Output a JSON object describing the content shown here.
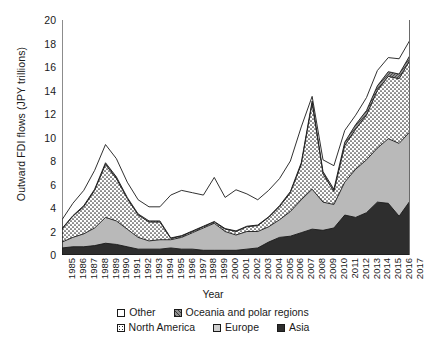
{
  "chart_data": {
    "type": "area",
    "title": "",
    "xlabel": "Year",
    "ylabel": "Outward FDI flows (JPY trillions)",
    "ylim": [
      0,
      20
    ],
    "yticks": [
      0,
      2,
      4,
      6,
      8,
      10,
      12,
      14,
      16,
      18,
      20
    ],
    "grid": false,
    "stacked": true,
    "legend_position": "bottom",
    "categories": [
      "1985",
      "1986",
      "1987",
      "1988",
      "1989",
      "1990",
      "1991",
      "1992",
      "1993",
      "1994",
      "1995",
      "1996",
      "1997",
      "1998",
      "1999",
      "2000",
      "2001",
      "2002",
      "2003",
      "2004",
      "2005",
      "2006",
      "2007",
      "2008",
      "2009",
      "2010",
      "2011",
      "2012",
      "2013",
      "2014",
      "2015",
      "2016",
      "2017"
    ],
    "series": [
      {
        "name": "Asia",
        "fill": "#2e2e2e",
        "pattern": "solid-dark",
        "values": [
          0.6,
          0.7,
          0.7,
          0.8,
          1.0,
          0.9,
          0.7,
          0.5,
          0.5,
          0.5,
          0.6,
          0.5,
          0.5,
          0.4,
          0.4,
          0.4,
          0.4,
          0.5,
          0.6,
          1.1,
          1.5,
          1.6,
          1.9,
          2.2,
          2.1,
          2.3,
          3.4,
          3.2,
          3.6,
          4.5,
          4.4,
          3.3,
          4.6
        ]
      },
      {
        "name": "Europe",
        "fill": "#b9b9b9",
        "pattern": "solid-light",
        "values": [
          0.5,
          0.8,
          1.1,
          1.5,
          2.2,
          2.0,
          1.5,
          1.0,
          0.7,
          0.8,
          0.7,
          1.0,
          1.4,
          1.9,
          2.3,
          1.6,
          1.3,
          1.5,
          1.4,
          1.3,
          1.5,
          2.1,
          2.8,
          3.4,
          2.4,
          2.0,
          2.8,
          4.1,
          4.5,
          4.6,
          5.5,
          6.2,
          5.9
        ]
      },
      {
        "name": "North America",
        "fill": "#ffffff",
        "pattern": "dotted",
        "values": [
          1.1,
          1.8,
          2.3,
          3.2,
          4.5,
          3.6,
          2.6,
          1.9,
          1.6,
          1.5,
          0.1,
          0.1,
          0.1,
          0.1,
          0.1,
          0.2,
          0.3,
          0.4,
          0.5,
          0.8,
          1.1,
          1.6,
          3.0,
          7.3,
          2.4,
          1.1,
          3.1,
          3.4,
          3.8,
          4.9,
          5.3,
          5.5,
          6.1
        ]
      },
      {
        "name": "Oceania and polar regions",
        "fill": "#8f8f8f",
        "pattern": "hatch",
        "values": [
          0.05,
          0.05,
          0.1,
          0.1,
          0.15,
          0.15,
          0.1,
          0.1,
          0.1,
          0.1,
          0.05,
          0.05,
          0.05,
          0.05,
          0.05,
          0.05,
          0.05,
          0.05,
          0.05,
          0.05,
          0.1,
          0.1,
          0.15,
          0.2,
          0.2,
          0.2,
          0.3,
          0.4,
          0.4,
          0.4,
          0.4,
          0.4,
          0.4
        ]
      },
      {
        "name": "Other",
        "fill": "#ffffff",
        "pattern": "open",
        "values": [
          0.75,
          1.05,
          1.3,
          1.6,
          1.55,
          1.55,
          1.3,
          1.2,
          1.2,
          1.2,
          3.65,
          3.85,
          3.25,
          2.65,
          3.75,
          2.65,
          3.5,
          2.75,
          2.15,
          2.25,
          2.3,
          2.6,
          3.05,
          0.4,
          1.0,
          2.0,
          1.0,
          0.8,
          1.1,
          1.3,
          1.2,
          1.3,
          1.3
        ]
      }
    ],
    "totals": [
      3.0,
      4.4,
      5.5,
      7.2,
      9.4,
      8.2,
      6.2,
      4.7,
      4.1,
      4.1,
      5.1,
      5.5,
      5.3,
      5.1,
      6.6,
      4.9,
      5.55,
      5.2,
      4.7,
      5.5,
      6.5,
      8.0,
      10.9,
      13.5,
      8.1,
      7.6,
      10.6,
      11.9,
      13.4,
      15.7,
      16.8,
      16.7,
      18.3
    ]
  },
  "legend": {
    "row1": [
      {
        "label": "Other",
        "swatch": "open"
      },
      {
        "label": "Oceania and polar regions",
        "swatch": "hatch"
      }
    ],
    "row2": [
      {
        "label": "North America",
        "swatch": "dotted"
      },
      {
        "label": "Europe",
        "swatch": "solid-light"
      },
      {
        "label": "Asia",
        "swatch": "solid-dark"
      }
    ]
  }
}
